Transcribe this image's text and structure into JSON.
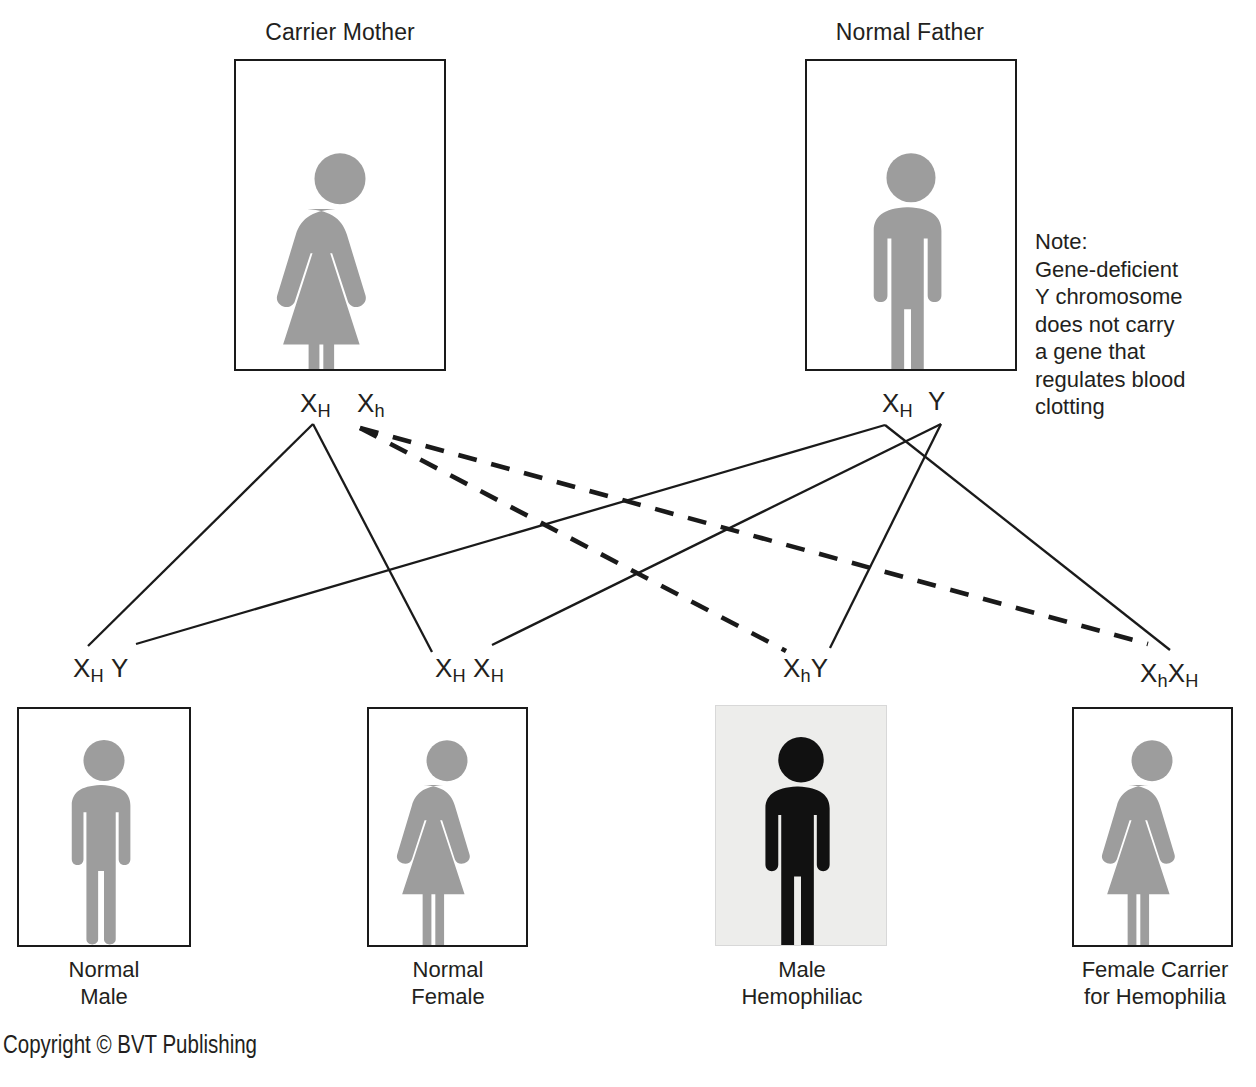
{
  "parents": [
    {
      "id": "carrier-mother",
      "title": "Carrier Mother",
      "sex": "female",
      "fill": "#9d9d9d",
      "alleles": [
        {
          "symbol": "X",
          "sub": "H"
        },
        {
          "symbol": "X",
          "sub": "h"
        }
      ]
    },
    {
      "id": "normal-father",
      "title": "Normal Father",
      "sex": "male",
      "fill": "#9d9d9d",
      "alleles": [
        {
          "symbol": "X",
          "sub": "H"
        },
        {
          "symbol": "Y",
          "sub": ""
        }
      ]
    }
  ],
  "note": {
    "text": "Note:\nGene-deficient\nY chromosome\ndoes not carry\na gene that\nregulates blood\nclotting"
  },
  "offspring": [
    {
      "id": "normal-male",
      "caption": "Normal\nMale",
      "sex": "male",
      "fill": "#9d9d9d",
      "affected": false,
      "genotype": [
        {
          "symbol": "X",
          "sub": "H"
        },
        {
          "symbol": "Y",
          "sub": ""
        }
      ]
    },
    {
      "id": "normal-female",
      "caption": "Normal\nFemale",
      "sex": "female",
      "fill": "#9d9d9d",
      "affected": false,
      "genotype": [
        {
          "symbol": "X",
          "sub": "H"
        },
        {
          "symbol": "X",
          "sub": "H"
        }
      ]
    },
    {
      "id": "male-hemophiliac",
      "caption": "Male\nHemophiliac",
      "sex": "male",
      "fill": "#111111",
      "affected": true,
      "genotype": [
        {
          "symbol": "X",
          "sub": "h"
        },
        {
          "symbol": "Y",
          "sub": ""
        }
      ]
    },
    {
      "id": "female-carrier",
      "caption": "Female Carrier\nfor Hemophilia",
      "sex": "female",
      "fill": "#9d9d9d",
      "affected": false,
      "genotype": [
        {
          "symbol": "X",
          "sub": "h"
        },
        {
          "symbol": "X",
          "sub": "H"
        }
      ]
    }
  ],
  "legend": {
    "solid_meaning": "dominant normal allele inheritance",
    "dashed_meaning": "recessive hemophilia allele inheritance"
  },
  "footer": {
    "copyright": "Copyright © BVT Publishing"
  },
  "colors": {
    "figure_gray": "#9d9d9d",
    "figure_black": "#111111",
    "affected_box_background": "#ededeb",
    "line": "#1a1a1a",
    "text": "#231f20"
  },
  "crosses": [
    {
      "from": "mother-XH",
      "to": "child-1",
      "style": "solid"
    },
    {
      "from": "mother-XH",
      "to": "child-2",
      "style": "solid"
    },
    {
      "from": "mother-Xh",
      "to": "child-3",
      "style": "dashed"
    },
    {
      "from": "mother-Xh",
      "to": "child-4",
      "style": "dashed"
    },
    {
      "from": "father-XH",
      "to": "child-1",
      "style": "solid"
    },
    {
      "from": "father-XH",
      "to": "child-4",
      "style": "solid"
    },
    {
      "from": "father-Y",
      "to": "child-2",
      "style": "solid"
    },
    {
      "from": "father-Y",
      "to": "child-3",
      "style": "solid"
    }
  ]
}
